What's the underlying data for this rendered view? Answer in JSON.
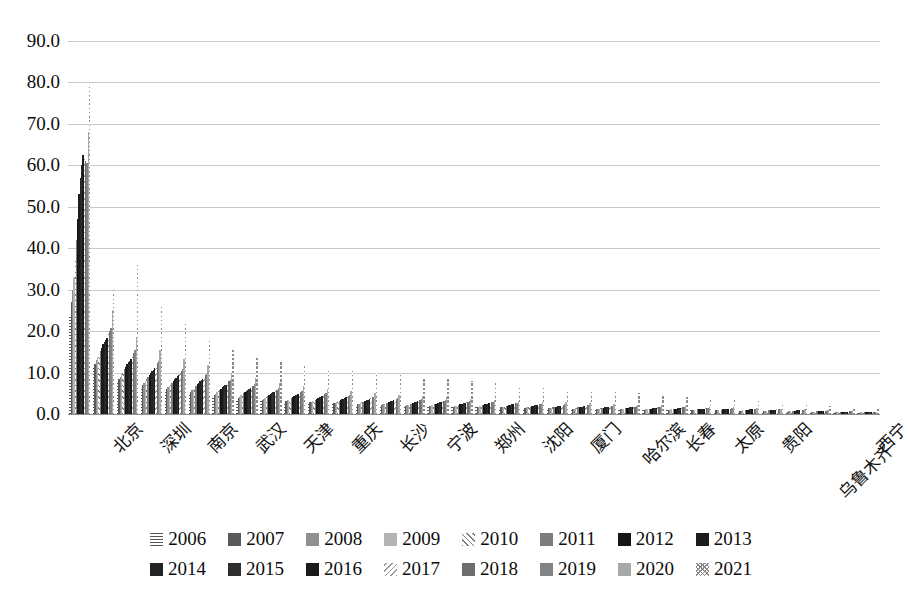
{
  "chart_data": {
    "type": "bar",
    "title": "",
    "xlabel": "",
    "ylabel": "",
    "ylim": [
      0,
      90
    ],
    "ytick_step": 10,
    "ytick_labels": [
      "0.0",
      "10.0",
      "20.0",
      "30.0",
      "40.0",
      "50.0",
      "60.0",
      "70.0",
      "80.0",
      "90.0"
    ],
    "grid": true,
    "legend_position": "bottom",
    "xtick_label_interval": 2,
    "categories": [
      "北京",
      "",
      "深圳",
      "",
      "南京",
      "",
      "武汉",
      "",
      "天津",
      "",
      "重庆",
      "",
      "长沙",
      "",
      "宁波",
      "",
      "郑州",
      "",
      "沈阳",
      "",
      "厦门",
      "",
      "哈尔滨",
      "",
      "长春",
      "",
      "太原",
      "",
      "贵阳",
      "",
      "乌鲁木齐",
      "",
      "西宁",
      ""
    ],
    "visible_xtick_labels": [
      "北京",
      "深圳",
      "南京",
      "武汉",
      "天津",
      "重庆",
      "长沙",
      "宁波",
      "郑州",
      "沈阳",
      "厦门",
      "哈尔滨",
      "长春",
      "太原",
      "贵阳",
      "乌鲁木齐",
      "西宁"
    ],
    "series": [
      {
        "name": "2006",
        "pattern": "horizontal-lines",
        "color": "#555555",
        "values": [
          24.0,
          11.2,
          7.8,
          6.5,
          5.6,
          5.0,
          4.2,
          3.6,
          3.2,
          2.9,
          2.6,
          2.4,
          2.2,
          2.0,
          1.9,
          1.8,
          1.7,
          1.6,
          1.5,
          1.4,
          1.3,
          1.2,
          1.1,
          1.0,
          1.0,
          0.9,
          0.9,
          0.8,
          0.8,
          0.7,
          0.6,
          0.5,
          0.4,
          0.3
        ]
      },
      {
        "name": "2007",
        "pattern": "solid",
        "color": "#5a5a5a",
        "values": [
          27.0,
          12.0,
          8.4,
          7.0,
          6.0,
          5.4,
          4.6,
          3.9,
          3.4,
          3.1,
          2.8,
          2.6,
          2.3,
          2.1,
          2.0,
          1.9,
          1.8,
          1.7,
          1.6,
          1.5,
          1.4,
          1.3,
          1.2,
          1.1,
          1.0,
          1.0,
          0.9,
          0.9,
          0.8,
          0.7,
          0.6,
          0.5,
          0.4,
          0.3
        ]
      },
      {
        "name": "2008",
        "pattern": "solid",
        "color": "#8f8f8f",
        "values": [
          30.0,
          13.0,
          9.0,
          7.5,
          6.4,
          5.8,
          4.9,
          4.2,
          3.7,
          3.3,
          3.0,
          2.7,
          2.5,
          2.3,
          2.1,
          2.0,
          1.9,
          1.8,
          1.7,
          1.6,
          1.4,
          1.3,
          1.2,
          1.2,
          1.1,
          1.0,
          1.0,
          0.9,
          0.8,
          0.8,
          0.7,
          0.6,
          0.5,
          0.4
        ]
      },
      {
        "name": "2009",
        "pattern": "solid",
        "color": "#b4b4b4",
        "values": [
          33.0,
          13.8,
          9.6,
          8.0,
          6.8,
          6.1,
          5.2,
          4.5,
          3.9,
          3.5,
          3.2,
          2.9,
          2.6,
          2.4,
          2.2,
          2.1,
          2.0,
          1.9,
          1.8,
          1.6,
          1.5,
          1.4,
          1.3,
          1.2,
          1.1,
          1.1,
          1.0,
          0.9,
          0.9,
          0.8,
          0.7,
          0.6,
          0.5,
          0.4
        ]
      },
      {
        "name": "2010",
        "pattern": "diagonal-forward",
        "color": "#7a7a7a",
        "values": [
          37.0,
          14.5,
          10.2,
          8.5,
          7.2,
          6.5,
          5.5,
          4.8,
          4.1,
          3.7,
          3.4,
          3.1,
          2.8,
          2.5,
          2.3,
          2.2,
          2.1,
          2.0,
          1.8,
          1.7,
          1.6,
          1.5,
          1.4,
          1.3,
          1.2,
          1.1,
          1.0,
          1.0,
          0.9,
          0.8,
          0.7,
          0.6,
          0.5,
          0.4
        ]
      },
      {
        "name": "2011",
        "pattern": "solid",
        "color": "#7d7d7d",
        "values": [
          42.0,
          15.2,
          10.8,
          9.0,
          7.6,
          6.8,
          5.8,
          5.0,
          4.3,
          3.9,
          3.5,
          3.2,
          2.9,
          2.7,
          2.5,
          2.3,
          2.2,
          2.1,
          1.9,
          1.8,
          1.7,
          1.6,
          1.5,
          1.4,
          1.3,
          1.2,
          1.1,
          1.0,
          0.9,
          0.9,
          0.8,
          0.7,
          0.5,
          0.4
        ]
      },
      {
        "name": "2012",
        "pattern": "solid",
        "color": "#151515",
        "values": [
          47.0,
          16.0,
          11.4,
          9.4,
          8.0,
          7.2,
          6.1,
          5.3,
          4.6,
          4.1,
          3.7,
          3.4,
          3.1,
          2.8,
          2.6,
          2.5,
          2.3,
          2.2,
          2.0,
          1.9,
          1.8,
          1.6,
          1.5,
          1.4,
          1.3,
          1.2,
          1.2,
          1.1,
          1.0,
          0.9,
          0.8,
          0.7,
          0.6,
          0.5
        ]
      },
      {
        "name": "2013",
        "pattern": "solid",
        "color": "#1c1c1c",
        "values": [
          53.0,
          16.8,
          12.0,
          9.9,
          8.4,
          7.5,
          6.4,
          5.6,
          4.8,
          4.3,
          3.9,
          3.6,
          3.2,
          3.0,
          2.7,
          2.6,
          2.4,
          2.3,
          2.1,
          2.0,
          1.8,
          1.7,
          1.6,
          1.5,
          1.4,
          1.3,
          1.2,
          1.1,
          1.0,
          0.9,
          0.8,
          0.7,
          0.6,
          0.5
        ]
      },
      {
        "name": "2014",
        "pattern": "solid",
        "color": "#242424",
        "values": [
          57.0,
          17.4,
          12.5,
          10.3,
          8.8,
          7.9,
          6.7,
          5.8,
          5.0,
          4.5,
          4.1,
          3.7,
          3.4,
          3.1,
          2.9,
          2.7,
          2.5,
          2.4,
          2.2,
          2.1,
          1.9,
          1.8,
          1.7,
          1.6,
          1.5,
          1.4,
          1.3,
          1.2,
          1.1,
          1.0,
          0.9,
          0.7,
          0.6,
          0.5
        ]
      },
      {
        "name": "2015",
        "pattern": "solid",
        "color": "#2e2e2e",
        "values": [
          60.0,
          17.9,
          12.9,
          10.7,
          9.1,
          8.2,
          6.9,
          6.0,
          5.2,
          4.7,
          4.2,
          3.9,
          3.5,
          3.2,
          3.0,
          2.8,
          2.6,
          2.5,
          2.3,
          2.1,
          2.0,
          1.9,
          1.7,
          1.6,
          1.5,
          1.4,
          1.3,
          1.2,
          1.1,
          1.0,
          0.9,
          0.8,
          0.6,
          0.5
        ]
      },
      {
        "name": "2016",
        "pattern": "solid",
        "color": "#1a1a1a",
        "values": [
          62.5,
          18.4,
          13.3,
          11.0,
          9.4,
          8.4,
          7.1,
          6.2,
          5.3,
          4.8,
          4.4,
          4.0,
          3.6,
          3.3,
          3.1,
          2.9,
          2.7,
          2.6,
          2.3,
          2.2,
          2.0,
          1.9,
          1.8,
          1.7,
          1.5,
          1.4,
          1.3,
          1.2,
          1.1,
          1.0,
          0.9,
          0.8,
          0.6,
          0.5
        ]
      },
      {
        "name": "2017",
        "pattern": "diagonal-back",
        "color": "#9a9a9a",
        "values": [
          62.0,
          19.2,
          14.0,
          11.6,
          9.9,
          8.8,
          7.5,
          6.5,
          5.6,
          5.0,
          4.6,
          4.2,
          3.8,
          3.5,
          3.2,
          3.0,
          2.8,
          2.7,
          2.4,
          2.3,
          2.1,
          2.0,
          1.8,
          1.7,
          1.6,
          1.5,
          1.4,
          1.3,
          1.2,
          1.1,
          0.9,
          0.8,
          0.7,
          0.5
        ]
      },
      {
        "name": "2018",
        "pattern": "solid",
        "color": "#6e6e6e",
        "values": [
          61.0,
          20.0,
          14.8,
          12.2,
          10.4,
          9.3,
          7.9,
          6.8,
          5.9,
          5.3,
          4.8,
          4.4,
          4.0,
          3.7,
          3.4,
          3.2,
          3.0,
          2.8,
          2.6,
          2.4,
          2.2,
          2.1,
          1.9,
          1.8,
          1.7,
          1.6,
          1.5,
          1.3,
          1.2,
          1.1,
          1.0,
          0.8,
          0.7,
          0.5
        ]
      },
      {
        "name": "2019",
        "pattern": "solid",
        "color": "#838383",
        "values": [
          60.5,
          20.8,
          15.5,
          12.8,
          10.9,
          9.7,
          8.3,
          7.2,
          6.2,
          5.6,
          5.0,
          4.6,
          4.2,
          3.8,
          3.6,
          3.3,
          3.1,
          3.0,
          2.7,
          2.5,
          2.3,
          2.2,
          2.0,
          1.9,
          1.8,
          1.6,
          1.5,
          1.4,
          1.3,
          1.1,
          1.0,
          0.9,
          0.7,
          0.6
        ]
      },
      {
        "name": "2020",
        "pattern": "solid",
        "color": "#a8a8a8",
        "values": [
          68.0,
          25.0,
          18.5,
          15.5,
          13.2,
          11.8,
          10.0,
          8.7,
          7.5,
          6.7,
          6.1,
          5.6,
          5.0,
          4.6,
          4.3,
          4.0,
          3.7,
          3.5,
          3.2,
          3.0,
          2.8,
          2.6,
          2.4,
          2.2,
          2.1,
          1.9,
          1.8,
          1.6,
          1.5,
          1.3,
          1.1,
          1.0,
          0.8,
          0.6
        ]
      },
      {
        "name": "2021",
        "pattern": "crosshatch",
        "color": "#8a8a8a",
        "values": [
          79.0,
          30.5,
          36.0,
          26.0,
          22.5,
          18.0,
          15.5,
          13.5,
          13.0,
          11.5,
          11.0,
          10.5,
          10.0,
          9.5,
          9.0,
          8.5,
          8.0,
          7.5,
          7.0,
          6.5,
          6.0,
          5.5,
          5.2,
          5.0,
          4.6,
          4.2,
          3.9,
          3.5,
          3.2,
          2.8,
          2.4,
          2.0,
          1.6,
          1.2
        ]
      }
    ]
  },
  "legend": {
    "rows": [
      [
        "2006",
        "2007",
        "2008",
        "2009",
        "2010",
        "2011",
        "2012",
        "2013"
      ],
      [
        "2014",
        "2015",
        "2016",
        "2017",
        "2018",
        "2019",
        "2020",
        "2021"
      ]
    ]
  }
}
